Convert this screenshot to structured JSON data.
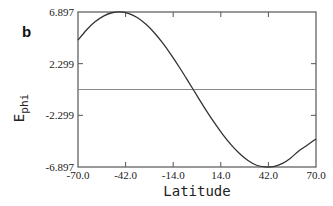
{
  "chart_data": {
    "type": "line",
    "panel_label": "b",
    "title": "",
    "xlabel": "Latitude",
    "ylabel_main": "E",
    "ylabel_sub": "phi",
    "xlim": [
      -70.0,
      70.0
    ],
    "ylim": [
      -6.897,
      6.897
    ],
    "xticks": [
      -70.0,
      -42.0,
      -14.0,
      14.0,
      42.0,
      70.0
    ],
    "xtick_labels": [
      "-70.0",
      "-42.0",
      "-14.0",
      "14.0",
      "42.0",
      "70.0"
    ],
    "yticks": [
      -6.897,
      -2.299,
      2.299,
      6.897
    ],
    "ytick_labels": [
      "-6.897",
      "-2.299",
      "2.299",
      "6.897"
    ],
    "grid": false,
    "reference_line": {
      "y": 0,
      "color": "#888888"
    },
    "series": [
      {
        "name": "E_phi",
        "color": "#333333",
        "x": [
          -70,
          -65,
          -60,
          -55,
          -50,
          -45,
          -40,
          -35,
          -30,
          -25,
          -20,
          -15,
          -10,
          -5,
          0,
          5,
          10,
          15,
          20,
          25,
          30,
          35,
          40,
          45,
          50,
          55,
          60,
          65,
          70
        ],
        "y": [
          4.4,
          5.3,
          6.02,
          6.53,
          6.83,
          6.9,
          6.75,
          6.38,
          5.8,
          5.03,
          4.1,
          3.04,
          1.89,
          0.68,
          -0.55,
          -1.76,
          -2.91,
          -3.97,
          -4.91,
          -5.7,
          -6.32,
          -6.74,
          -6.89,
          -6.86,
          -6.6,
          -6.11,
          -5.45,
          -4.94,
          -4.4
        ]
      }
    ]
  }
}
